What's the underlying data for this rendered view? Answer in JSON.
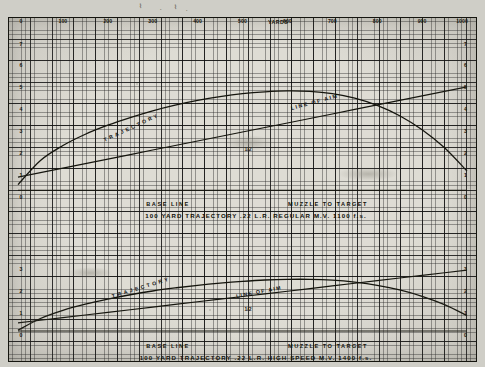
{
  "document": {
    "kind": "ballistics-trajectory-chart-sheet",
    "top_axis_label": "YARDS"
  },
  "x_axis": {
    "label": "YARDS",
    "ticks": [
      "0",
      "100",
      "200",
      "300",
      "400",
      "500",
      "600",
      "700",
      "800",
      "900",
      "1000"
    ],
    "range": [
      0,
      1000
    ]
  },
  "y_axis": {
    "upper_ticks": [
      "7",
      "6",
      "5",
      "4",
      "3",
      "2",
      "1",
      "0"
    ],
    "lower_ticks": [
      "3",
      "2",
      "1",
      "0"
    ]
  },
  "upper_chart": {
    "title": "100 YARD TRAJECTORY  .22 L.R. REGULAR  M.V. 1100 f.s.",
    "title_parts": {
      "distance": "100 YARD TRAJECTORY",
      "cartridge": ".22 L.R. REGULAR",
      "velocity": "M.V. 1100 f.s."
    },
    "baseline_label": "BASE LINE",
    "muzzle_label": "MUZZLE TO TARGET",
    "trajectory_label": "TRAJECTORY",
    "line_of_aim_label": "LINE OF AIM",
    "midpoint_mark": "1/2"
  },
  "lower_chart": {
    "title": "100 YARD TRAJECTORY  .22 L.R. HIGH SPEED  M.V. 1400 f.s.",
    "title_parts": {
      "distance": "100 YARD TRAJECTORY",
      "cartridge": ".22 L.R. HIGH SPEED",
      "velocity": "M.V. 1400 f.s."
    },
    "baseline_label": "BASE LINE",
    "muzzle_label": "MUZZLE TO TARGET",
    "trajectory_label": "TRAJECTORY",
    "line_of_aim_label": "LINE OF AIM",
    "midpoint_mark": "1/2"
  },
  "colors": {
    "paper": "#dedcd4",
    "ink": "#101008",
    "grid_fine": "#6d6b62",
    "grid_bold": "#20201a",
    "backdrop": "#cfcec7"
  },
  "chart_data": {
    "type": "line",
    "xlabel": "YARDS",
    "ylabel": "",
    "grid": true,
    "legend": "inline-curve-labels",
    "xlim": [
      0,
      1000
    ],
    "panels": [
      {
        "name": "upper",
        "title": "100 YARD TRAJECTORY  .22 L.R. REGULAR  M.V. 1100 f.s.",
        "ylim": [
          0,
          7
        ],
        "yticks": [
          0,
          1,
          2,
          3,
          4,
          5,
          6,
          7
        ],
        "x": [
          0,
          50,
          100,
          150,
          200,
          250,
          300,
          350,
          400,
          450,
          500,
          550,
          600,
          650,
          700,
          750,
          800,
          850,
          900,
          950,
          1000
        ],
        "series": [
          {
            "name": "TRAJECTORY",
            "values": [
              0.55,
              1.62,
              2.28,
              2.78,
              3.18,
              3.52,
              3.82,
              4.07,
              4.28,
              4.45,
              4.58,
              4.66,
              4.7,
              4.68,
              4.58,
              4.38,
              4.06,
              3.6,
              2.98,
              2.18,
              1.15
            ]
          },
          {
            "name": "LINE OF AIM",
            "values": [
              0.88,
              1.08,
              1.28,
              1.48,
              1.68,
              1.88,
              2.08,
              2.28,
              2.48,
              2.68,
              2.88,
              3.08,
              3.28,
              3.48,
              3.68,
              3.88,
              4.08,
              4.28,
              4.48,
              4.68,
              4.88
            ]
          },
          {
            "name": "BASE LINE",
            "values": [
              0.3,
              0.3,
              0.3,
              0.3,
              0.3,
              0.3,
              0.3,
              0.3,
              0.3,
              0.3,
              0.3,
              0.3,
              0.3,
              0.3,
              0.3,
              0.3,
              0.3,
              0.3,
              0.3,
              0.3,
              0.3
            ]
          }
        ],
        "annotations": [
          "BASE LINE",
          "MUZZLE TO TARGET",
          "1/2"
        ]
      },
      {
        "name": "lower",
        "title": "100 YARD TRAJECTORY  .22 L.R. HIGH SPEED  M.V. 1400 f.s.",
        "ylim": [
          0,
          3
        ],
        "yticks": [
          0,
          1,
          2,
          3
        ],
        "x": [
          0,
          50,
          100,
          150,
          200,
          250,
          300,
          350,
          400,
          450,
          500,
          550,
          600,
          650,
          700,
          750,
          800,
          850,
          900,
          950,
          1000
        ],
        "series": [
          {
            "name": "TRAJECTORY",
            "values": [
              0.22,
              0.75,
              1.12,
              1.4,
              1.63,
              1.83,
              2.0,
              2.14,
              2.26,
              2.36,
              2.44,
              2.5,
              2.53,
              2.53,
              2.49,
              2.4,
              2.26,
              2.05,
              1.76,
              1.38,
              0.88
            ]
          },
          {
            "name": "LINE OF AIM",
            "values": [
              0.55,
              0.67,
              0.79,
              0.91,
              1.03,
              1.15,
              1.27,
              1.39,
              1.51,
              1.63,
              1.75,
              1.87,
              1.99,
              2.11,
              2.23,
              2.35,
              2.47,
              2.59,
              2.71,
              2.83,
              2.95
            ]
          },
          {
            "name": "BASE LINE",
            "values": [
              0.18,
              0.18,
              0.18,
              0.18,
              0.18,
              0.18,
              0.18,
              0.18,
              0.18,
              0.18,
              0.18,
              0.18,
              0.18,
              0.18,
              0.18,
              0.18,
              0.18,
              0.18,
              0.18,
              0.18,
              0.18
            ]
          }
        ],
        "annotations": [
          "BASE LINE",
          "MUZZLE TO TARGET",
          "1/2"
        ]
      }
    ]
  }
}
